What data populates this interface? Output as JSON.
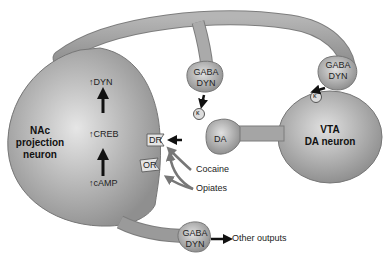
{
  "nac_neuron": {
    "label_line1": "NAc",
    "label_line2": "projection",
    "label_line3": "neuron",
    "cascade": [
      {
        "arrow": "↑",
        "text": "DYN"
      },
      {
        "arrow": "↑",
        "text": "CREB"
      },
      {
        "arrow": "↑",
        "text": "cAMP"
      }
    ]
  },
  "vta_neuron": {
    "label_line1": "VTA",
    "label_line2": "DA neuron"
  },
  "terminals": [
    {
      "line1": "GABA",
      "line2": "DYN",
      "position": "top-middle"
    },
    {
      "line1": "GABA",
      "line2": "DYN",
      "position": "top-right"
    },
    {
      "line1": "GABA",
      "line2": "DYN",
      "position": "bottom"
    }
  ],
  "receptors": {
    "dr": "DR",
    "or": "OR",
    "kappa1": "κ",
    "kappa2": "κ"
  },
  "da_terminal": "DA",
  "drugs": {
    "cocaine": "Cocaine",
    "opiates": "Opiates"
  },
  "other_outputs": "Other outputs",
  "colors": {
    "neuron_fill_light": "#d4d4d4",
    "neuron_fill_dark": "#8e8e8e",
    "arrow_black": "#111111",
    "drug_arrow_gray": "#777777"
  }
}
